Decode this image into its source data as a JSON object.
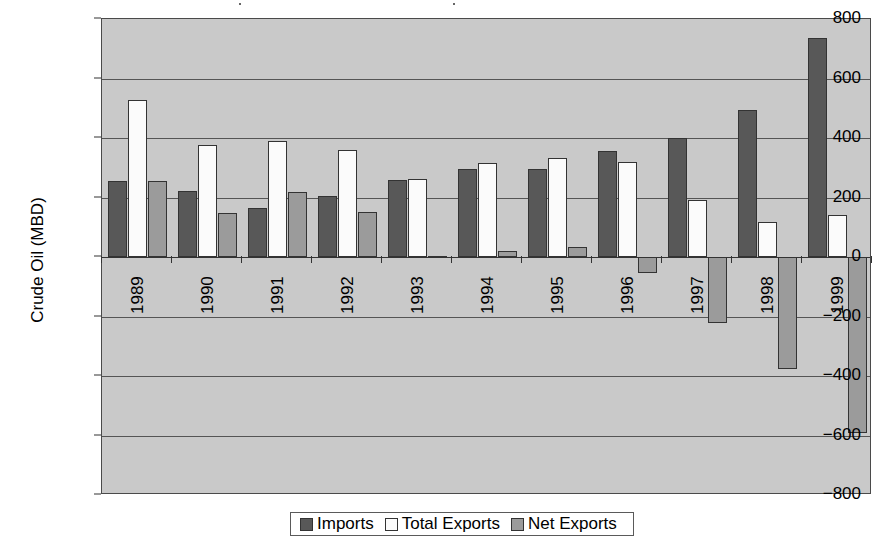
{
  "chart_data": {
    "type": "bar",
    "title": "",
    "xlabel": "",
    "ylabel": "Crude Oil (MBD)",
    "categories": [
      "1989",
      "1990",
      "1991",
      "1992",
      "1993",
      "1994",
      "1995",
      "1996",
      "1997",
      "1998",
      "1999"
    ],
    "series": [
      {
        "name": "Imports",
        "color": "#585858",
        "values": [
          255,
          222,
          165,
          205,
          260,
          295,
          297,
          357,
          400,
          495,
          735
        ]
      },
      {
        "name": "Total Exports",
        "color": "#fbfbfb",
        "values": [
          527,
          375,
          390,
          358,
          262,
          315,
          333,
          320,
          192,
          118,
          140
        ]
      },
      {
        "name": "Net Exports",
        "color": "#9b9b9b",
        "values": [
          255,
          148,
          220,
          152,
          2,
          20,
          35,
          -55,
          -222,
          -378,
          -592
        ]
      }
    ],
    "ylim": [
      -800,
      800
    ],
    "yticks": [
      800,
      600,
      400,
      200,
      0,
      -200,
      -400,
      -600,
      -800
    ],
    "ytick_labels": [
      "800",
      "600",
      "400",
      "200",
      "0",
      "−200",
      "−400",
      "−600",
      "−800"
    ],
    "grid": true,
    "legend_position": "bottom"
  },
  "legend": {
    "items": [
      {
        "label": "Imports",
        "color": "#585858"
      },
      {
        "label": "Total Exports",
        "color": "#fbfbfb"
      },
      {
        "label": "Net Exports",
        "color": "#9b9b9b"
      }
    ]
  }
}
